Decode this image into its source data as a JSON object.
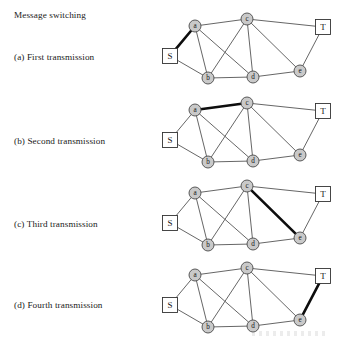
{
  "figure": {
    "title": "Message switching",
    "captions": [
      "(a) First transmission",
      "(b) Second transmission",
      "(c) Third transmission",
      "(d) Fourth transmission"
    ]
  },
  "graph": {
    "node_labels": {
      "S": "S",
      "a": "a",
      "b": "b",
      "c": "c",
      "d": "d",
      "e": "e",
      "T": "T"
    },
    "nodes": [
      {
        "id": "S",
        "label": "S",
        "shape": "box",
        "x": 20,
        "y": 52
      },
      {
        "id": "a",
        "label": "a",
        "shape": "circle",
        "x": 45,
        "y": 22
      },
      {
        "id": "b",
        "label": "b",
        "shape": "circle",
        "x": 58,
        "y": 74
      },
      {
        "id": "c",
        "label": "c",
        "shape": "circle",
        "x": 97,
        "y": 15
      },
      {
        "id": "d",
        "label": "d",
        "shape": "circle",
        "x": 103,
        "y": 73
      },
      {
        "id": "e",
        "label": "e",
        "shape": "circle",
        "x": 150,
        "y": 67
      },
      {
        "id": "T",
        "label": "T",
        "shape": "box",
        "x": 173,
        "y": 23
      }
    ],
    "edges": [
      [
        "S",
        "a"
      ],
      [
        "S",
        "b"
      ],
      [
        "a",
        "b"
      ],
      [
        "a",
        "c"
      ],
      [
        "a",
        "d"
      ],
      [
        "b",
        "c"
      ],
      [
        "b",
        "d"
      ],
      [
        "c",
        "d"
      ],
      [
        "c",
        "e"
      ],
      [
        "c",
        "T"
      ],
      [
        "d",
        "e"
      ],
      [
        "e",
        "T"
      ]
    ]
  },
  "chart_data": {
    "type": "diagram",
    "title": "Message switching",
    "route": [
      "S",
      "a",
      "c",
      "e",
      "T"
    ],
    "panels": [
      {
        "key": "a",
        "caption": "(a) First transmission",
        "highlighted_edge": [
          "S",
          "a"
        ]
      },
      {
        "key": "b",
        "caption": "(b) Second transmission",
        "highlighted_edge": [
          "a",
          "c"
        ]
      },
      {
        "key": "c",
        "caption": "(c) Third transmission",
        "highlighted_edge": [
          "c",
          "e"
        ]
      },
      {
        "key": "d",
        "caption": "(d) Fourth transmission",
        "highlighted_edge": [
          "e",
          "T"
        ]
      }
    ],
    "colors": {
      "background": "#ffffff",
      "edge": "#555555",
      "highlighted_edge": "#0d0d0d",
      "node_fill": "#c9c9c9",
      "node_stroke": "#4a4a4a",
      "terminal_fill": "#ffffff",
      "text": "#1a1a1a"
    }
  }
}
